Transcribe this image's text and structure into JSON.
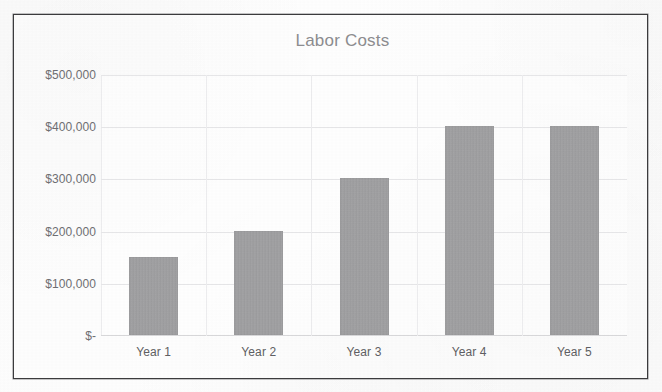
{
  "chart_data": {
    "type": "bar",
    "title": "Labor Costs",
    "xlabel": "",
    "ylabel": "",
    "categories": [
      "Year 1",
      "Year 2",
      "Year 3",
      "Year 4",
      "Year 5"
    ],
    "values": [
      150000,
      200000,
      300000,
      400000,
      400000
    ],
    "ylim": [
      0,
      500000
    ],
    "ytick_values": [
      500000,
      400000,
      300000,
      200000,
      100000,
      0
    ],
    "ytick_labels": [
      "$500,000",
      "$400,000",
      "$300,000",
      "$200,000",
      "$100,000",
      "$-"
    ],
    "grid": true,
    "legend": false,
    "legend_position": "none",
    "series": [
      {
        "name": "Labor Costs",
        "values": [
          150000,
          200000,
          300000,
          400000,
          400000
        ]
      }
    ]
  },
  "colors": {
    "bar_fill": "#a2a2a4",
    "title_text": "#8d8d90",
    "axis_text": "#6f6f73",
    "category_text": "#5f5f63",
    "gridline": "#e6e6e8",
    "frame_border": "#3b3b3d",
    "page_background": "#fdfdfd"
  },
  "artifacts": {
    "bleed_through": [
      "",
      "",
      ""
    ]
  }
}
